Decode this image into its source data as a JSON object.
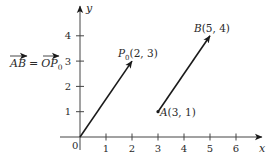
{
  "equation": {
    "lhs": "AB",
    "equals": "=",
    "rhs_main": "OP",
    "rhs_sub": "0"
  },
  "axes": {
    "x_label": "x",
    "y_label": "y",
    "origin_label": "0",
    "x_ticks": [
      "1",
      "2",
      "3",
      "4",
      "5",
      "6"
    ],
    "y_ticks": [
      "1",
      "2",
      "3",
      "4"
    ]
  },
  "points": {
    "P0": {
      "name": "P",
      "sub": "0",
      "coords": "(2, 3)",
      "x": 2,
      "y": 3
    },
    "A": {
      "name": "A",
      "coords": "(3, 1)",
      "x": 3,
      "y": 1
    },
    "B": {
      "name": "B",
      "coords": "(5, 4)",
      "x": 5,
      "y": 4
    },
    "O": {
      "x": 0,
      "y": 0
    }
  },
  "vectors": [
    {
      "name": "OP0",
      "from": "O",
      "to": "P0"
    },
    {
      "name": "AB",
      "from": "A",
      "to": "B"
    }
  ],
  "colors": {
    "ink": "#1a1a1a"
  }
}
